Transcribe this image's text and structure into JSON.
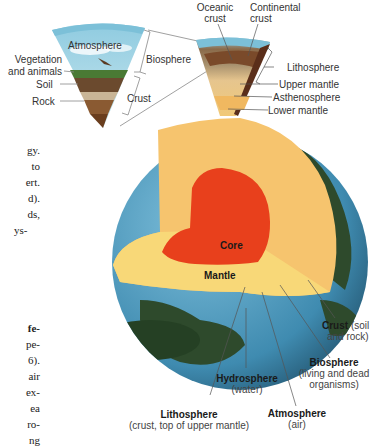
{
  "left_wedge": {
    "atmosphere": "Atmosphere",
    "vegetation": "Vegetation",
    "and_animals": "and animals",
    "soil": "Soil",
    "rock": "Rock",
    "biosphere": "Biosphere",
    "crust": "Crust"
  },
  "right_wedge": {
    "oceanic_1": "Oceanic",
    "oceanic_2": "crust",
    "continental_1": "Continental",
    "continental_2": "crust",
    "lithosphere": "Lithosphere",
    "upper_mantle": "Upper mantle",
    "asthenosphere": "Asthenosphere",
    "lower_mantle": "Lower mantle"
  },
  "globe": {
    "core": "Core",
    "mantle": "Mantle"
  },
  "bottom_labels": {
    "crust_bold": "Crust",
    "crust_rest_1": " (soil",
    "crust_rest_2": "and rock)",
    "biosphere_bold": "Biosphere",
    "biosphere_sub_1": "(living and dead",
    "biosphere_sub_2": "organisms)",
    "hydrosphere_bold": "Hydrosphere",
    "hydrosphere_sub": "(water)",
    "atmosphere_bold": "Atmosphere",
    "atmosphere_sub": "(air)",
    "lithosphere_bold": "Lithosphere",
    "lithosphere_sub": "(crust, top of upper mantle)"
  },
  "body_text_fragments": {
    "upper": [
      "gy.",
      "to",
      "ert.",
      "d).",
      "ds,",
      "ys-"
    ],
    "lower": [
      "fe-",
      "pe-",
      "6).",
      "air",
      "ex-",
      "ea",
      "ro-",
      "ng"
    ]
  },
  "colors": {
    "core": "#e8401c",
    "mantle_outer": "#f6c46e",
    "mantle_flat": "#f8d878",
    "ocean": "#5aa3c4",
    "land": "#2e4a2c",
    "sky": "#9fd3e6"
  }
}
